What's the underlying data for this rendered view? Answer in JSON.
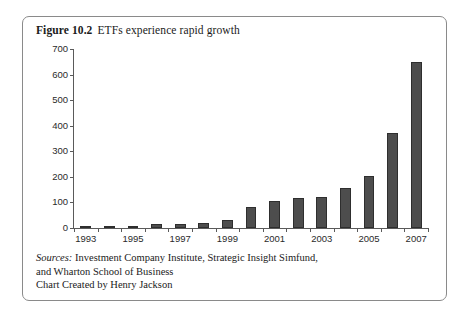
{
  "figure": {
    "label": "Figure 10.2",
    "title": "ETFs experience rapid growth"
  },
  "sources": {
    "label": "Sources:",
    "line1": "Investment Company Institute, Strategic Insight Simfund,",
    "line2": "and Wharton School of Business",
    "line3": "Chart Created by Henry Jackson"
  },
  "colors": {
    "bar_fill": "#4d4d4d",
    "bar_stroke": "#2e2e2e",
    "axis": "#5a5a5a",
    "frame": "#8a8a8a",
    "text": "#1a1a1a"
  },
  "chart_data": {
    "type": "bar",
    "title": "ETFs experience rapid growth",
    "xlabel": "",
    "ylabel": "",
    "ylim": [
      0,
      700
    ],
    "yticks": [
      0,
      100,
      200,
      300,
      400,
      500,
      600,
      700
    ],
    "grid": false,
    "legend": false,
    "xtick_labels": [
      "1993",
      "1995",
      "1997",
      "1999",
      "2001",
      "2003",
      "2005",
      "2007"
    ],
    "categories": [
      "1993",
      "1994",
      "1995",
      "1996",
      "1997",
      "1998",
      "1999",
      "2000",
      "2001",
      "2002",
      "2003",
      "2004",
      "2005",
      "2006",
      "2007"
    ],
    "values": [
      1,
      1,
      2,
      15,
      17,
      20,
      33,
      83,
      105,
      118,
      122,
      155,
      205,
      370,
      650
    ]
  }
}
